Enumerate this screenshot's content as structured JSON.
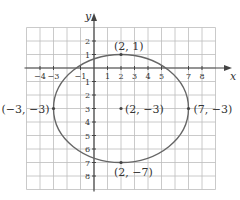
{
  "chart_data": {
    "type": "scatter",
    "title": "",
    "xlabel": "x",
    "ylabel": "y",
    "xlim": [
      -5,
      9
    ],
    "ylim": [
      -9,
      3
    ],
    "grid": true,
    "x_ticks": [
      "-4",
      "-3",
      "-1",
      "1",
      "2",
      "3",
      "4",
      "5",
      "7",
      "8"
    ],
    "y_ticks": [
      "2",
      "1",
      "-1",
      "-2",
      "-3",
      "-4",
      "-5",
      "-6",
      "-7",
      "-8"
    ],
    "x_tick_values": [
      -4,
      -3,
      -1,
      1,
      2,
      3,
      4,
      5,
      7,
      8
    ],
    "y_tick_values": [
      2,
      1,
      -1,
      -2,
      -3,
      -4,
      -5,
      -6,
      -7,
      -8
    ],
    "curve": {
      "kind": "ellipse",
      "center": [
        2,
        -3
      ],
      "a": 5,
      "b": 4
    },
    "points": [
      {
        "x": 2,
        "y": 1,
        "label": "(2, 1)"
      },
      {
        "x": -3,
        "y": -3,
        "label": "(−3, −3)"
      },
      {
        "x": 2,
        "y": -3,
        "label": "(2, −3)"
      },
      {
        "x": 7,
        "y": -3,
        "label": "(7, −3)"
      },
      {
        "x": 2,
        "y": -7,
        "label": "(2, −7)"
      }
    ],
    "colors": {
      "grid": "#bdbdbd",
      "axis": "#444444",
      "curve": "#666666"
    }
  }
}
